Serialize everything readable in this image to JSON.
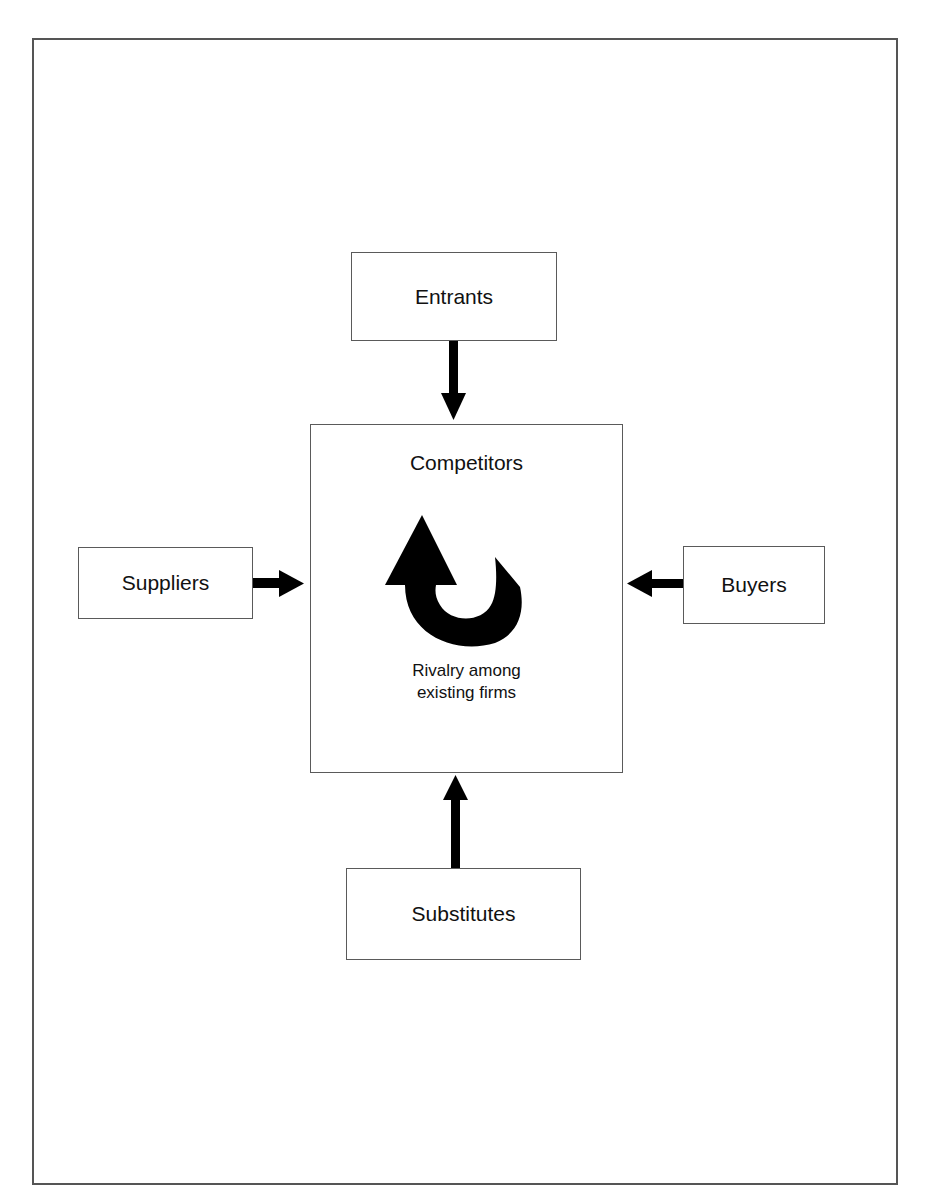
{
  "diagram": {
    "type": "five-forces",
    "center": {
      "title": "Competitors",
      "caption_line1": "Rivalry among",
      "caption_line2": "existing firms",
      "icon": "u-turn-arrow-icon"
    },
    "forces": {
      "top": {
        "label": "Entrants",
        "arrow_direction": "down"
      },
      "left": {
        "label": "Suppliers",
        "arrow_direction": "right"
      },
      "right": {
        "label": "Buyers",
        "arrow_direction": "left"
      },
      "bottom": {
        "label": "Substitutes",
        "arrow_direction": "up"
      }
    },
    "colors": {
      "background": "#ffffff",
      "border": "#5a5a5a",
      "arrow": "#000000",
      "text": "#111111"
    }
  }
}
